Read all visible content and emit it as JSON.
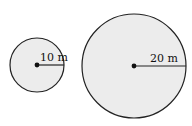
{
  "diagram": {
    "type": "two circles with labeled radii",
    "fill_color": "#ececec",
    "stroke_color": "#222222",
    "circles": [
      {
        "name": "small",
        "radius_label": "10 m"
      },
      {
        "name": "large",
        "radius_label": "20 m"
      }
    ]
  }
}
